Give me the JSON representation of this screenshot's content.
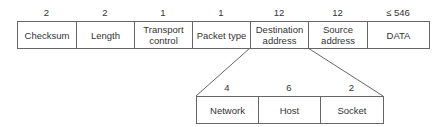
{
  "top_row": {
    "fields": [
      {
        "size": "2",
        "label": "Checksum",
        "width": 59
      },
      {
        "size": "2",
        "label": "Length",
        "width": 58
      },
      {
        "size": "1",
        "label": "Transport control",
        "width": 58
      },
      {
        "size": "1",
        "label": "Packet type",
        "width": 58
      },
      {
        "size": "12",
        "label": "Destination address",
        "width": 58
      },
      {
        "size": "12",
        "label": "Source address",
        "width": 59
      },
      {
        "size": "≤ 546",
        "label": "DATA",
        "width": 62
      }
    ]
  },
  "bottom_row": {
    "fields": [
      {
        "size": "4",
        "label": "Network",
        "width": 62
      },
      {
        "size": "6",
        "label": "Host",
        "width": 62
      },
      {
        "size": "2",
        "label": "Socket",
        "width": 63
      }
    ]
  },
  "colors": {
    "line": "#666666",
    "text": "#333333"
  }
}
